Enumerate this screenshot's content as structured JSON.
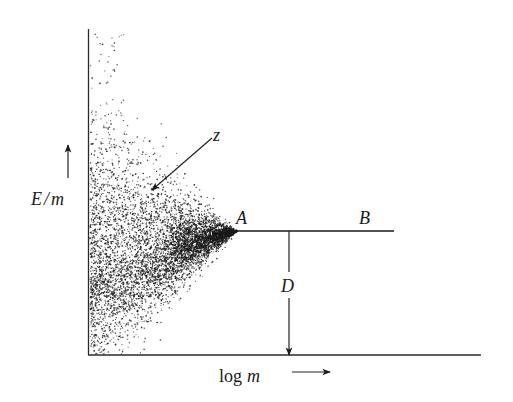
{
  "diagram": {
    "y_axis_label": "E/m",
    "y_axis_label_E": "E",
    "y_axis_label_slash": "/",
    "y_axis_label_m": "m",
    "x_axis_label_log": "log",
    "x_axis_label_m": "m",
    "x_axis_label": "log m",
    "point_labels": {
      "z": "z",
      "A": "A",
      "B": "B",
      "D": "D"
    },
    "colors": {
      "ink": "#1a1a1a",
      "background": "#ffffff"
    },
    "scatter": {
      "description": "Dense point cloud converging toward point A along the E/m axis",
      "apex": [
        237,
        231
      ],
      "axis_x": 89,
      "top_y": 30,
      "bottom_y": 354,
      "count": 5200,
      "seed": 7
    }
  }
}
